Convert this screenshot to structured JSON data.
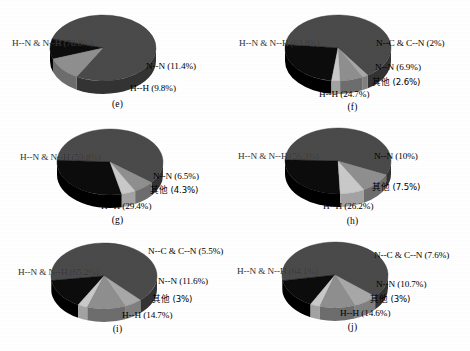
{
  "figure": {
    "background_color": "#ffffff",
    "text_color": "#000000",
    "panel_count": 6
  },
  "colors": {
    "slice_main": "#4a4a4a",
    "slice_main_side": "#333333",
    "slice_hh": "#0c0c0c",
    "slice_hh_side": "#000000",
    "slice_nn": "#8f8f8f",
    "slice_nn_side": "#6d6d6d",
    "slice_other": "#c9c9c9",
    "slice_other_side": "#a3a3a3",
    "slice_ncn": "#a8a8a8",
    "slice_ncn_side": "#808080"
  },
  "panels": [
    {
      "caption": "(e)",
      "labels": {
        "main": "H--N & N--H (78.8%)",
        "nn": "N--N (11.4%)",
        "hh": "H--H (9.8%)",
        "other": "",
        "ncn": ""
      }
    },
    {
      "caption": "(f)",
      "labels": {
        "main": "H--N & N--H (63.8%)",
        "ncn": "N--C & C--N (2%)",
        "nn": "N--N (6.9%)",
        "other": "其他 (2.6%)",
        "hh": "H--H (24.7%)"
      }
    },
    {
      "caption": "(g)",
      "labels": {
        "main": "H--N & N--H (59.8%)",
        "nn": "N--N (6.5%)",
        "other": "其他 (4.3%)",
        "hh": "H--H (29.4%)",
        "ncn": ""
      }
    },
    {
      "caption": "(h)",
      "labels": {
        "main": "H--N & N--H (56.3%)",
        "nn": "N--N (10%)",
        "other": "其他 (7.5%)",
        "hh": "H--H (26.2%)",
        "ncn": ""
      }
    },
    {
      "caption": "(i)",
      "labels": {
        "main": "H--N & N--H (65.2%)",
        "ncn": "N--C & C--N (5.5%)",
        "nn": "N--N (11.6%)",
        "other": "其他 (3%)",
        "hh": "H--H (14.7%)"
      }
    },
    {
      "caption": "(j)",
      "labels": {
        "main": "H--N & N--H (64.1%)",
        "ncn": "N--C & C--N (7.6%)",
        "nn": "N--N (10.7%)",
        "other": "其他 (3%)",
        "hh": "H--H (14.6%)"
      }
    }
  ],
  "chart_data": [
    {
      "type": "pie",
      "title": "(e)",
      "labels": [
        "H--N & N--H",
        "N--N",
        "H--H"
      ],
      "values": [
        78.8,
        11.4,
        9.8
      ],
      "units": "%",
      "legend": "none",
      "annotations": [
        "H--N & N--H (78.8%)",
        "N--N (11.4%)",
        "H--H (9.8%)"
      ]
    },
    {
      "type": "pie",
      "title": "(f)",
      "labels": [
        "H--N & N--H",
        "N--C & C--N",
        "N--N",
        "其他",
        "H--H"
      ],
      "values": [
        63.8,
        2.0,
        6.9,
        2.6,
        24.7
      ],
      "units": "%",
      "legend": "none",
      "annotations": [
        "H--N & N--H (63.8%)",
        "N--C & C--N (2%)",
        "N--N (6.9%)",
        "其他 (2.6%)",
        "H--H (24.7%)"
      ]
    },
    {
      "type": "pie",
      "title": "(g)",
      "labels": [
        "H--N & N--H",
        "N--N",
        "其他",
        "H--H"
      ],
      "values": [
        59.8,
        6.5,
        4.3,
        29.4
      ],
      "units": "%",
      "legend": "none",
      "annotations": [
        "H--N & N--H (59.8%)",
        "N--N (6.5%)",
        "其他 (4.3%)",
        "H--H (29.4%)"
      ]
    },
    {
      "type": "pie",
      "title": "(h)",
      "labels": [
        "H--N & N--H",
        "N--N",
        "其他",
        "H--H"
      ],
      "values": [
        56.3,
        10.0,
        7.5,
        26.2
      ],
      "units": "%",
      "legend": "none",
      "annotations": [
        "H--N & N--H (56.3%)",
        "N--N (10%)",
        "其他 (7.5%)",
        "H--H (26.2%)"
      ]
    },
    {
      "type": "pie",
      "title": "(i)",
      "labels": [
        "H--N & N--H",
        "N--C & C--N",
        "N--N",
        "其他",
        "H--H"
      ],
      "values": [
        65.2,
        5.5,
        11.6,
        3.0,
        14.7
      ],
      "units": "%",
      "legend": "none",
      "annotations": [
        "H--N & N--H (65.2%)",
        "N--C & C--N (5.5%)",
        "N--N (11.6%)",
        "其他 (3%)",
        "H--H (14.7%)"
      ]
    },
    {
      "type": "pie",
      "title": "(j)",
      "labels": [
        "H--N & N--H",
        "N--C & C--N",
        "N--N",
        "其他",
        "H--H"
      ],
      "values": [
        64.1,
        7.6,
        10.7,
        3.0,
        14.6
      ],
      "units": "%",
      "legend": "none",
      "annotations": [
        "H--N & N--H (64.1%)",
        "N--C & C--N (7.6%)",
        "N--N (10.7%)",
        "其他 (3%)",
        "H--H (14.6%)"
      ]
    }
  ]
}
